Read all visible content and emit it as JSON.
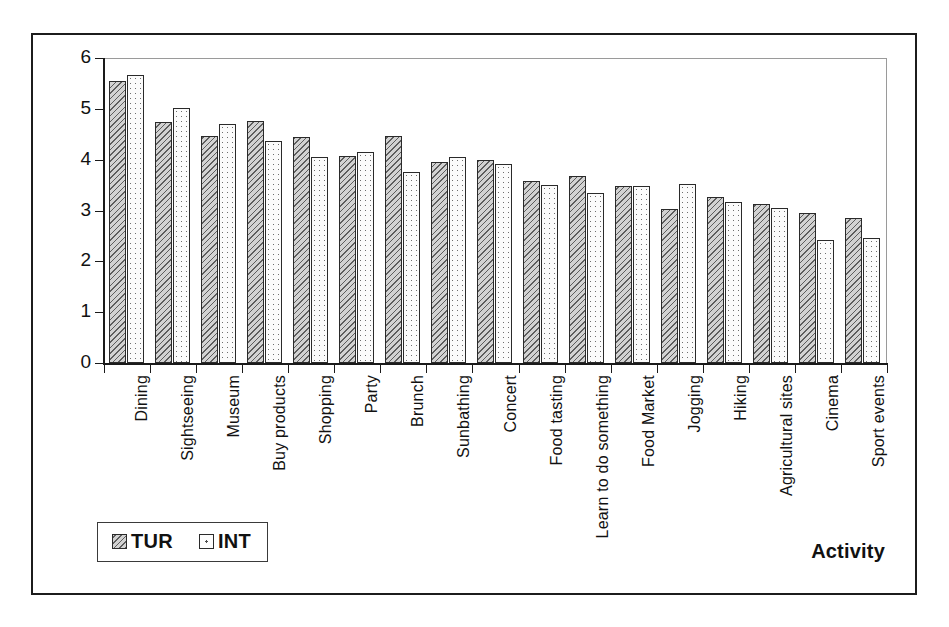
{
  "chart_data": {
    "type": "bar",
    "title": "",
    "xlabel": "Activity",
    "ylabel": "Average (weigthed)",
    "ylim": [
      0,
      6
    ],
    "ytick_labels": [
      "6",
      "5",
      "4",
      "3",
      "2",
      "1",
      "0"
    ],
    "ytick_values": [
      6,
      5,
      4,
      3,
      2,
      1,
      0
    ],
    "grid": false,
    "legend_position": "bottom-left",
    "categories": [
      "Dining",
      "Sightseeing",
      "Museum",
      "Buy products",
      "Shopping",
      "Party",
      "Brunch",
      "Sunbathing",
      "Concert",
      "Food tasting",
      "Learn to do something",
      "Food Market",
      "Jogging",
      "Hiking",
      "Agricultural sites",
      "Cinema",
      "Sport events"
    ],
    "series": [
      {
        "name": "TUR",
        "pattern": "diagonal-hatch",
        "values": [
          5.54,
          4.75,
          4.46,
          4.76,
          4.45,
          4.08,
          4.47,
          3.95,
          3.99,
          3.59,
          3.68,
          3.49,
          3.02,
          3.26,
          3.13,
          2.96,
          2.86
        ]
      },
      {
        "name": "INT",
        "pattern": "dotted",
        "values": [
          5.66,
          5.01,
          4.71,
          4.36,
          4.06,
          4.16,
          3.76,
          4.05,
          3.92,
          3.51,
          3.34,
          3.49,
          3.52,
          3.17,
          3.05,
          2.42,
          2.46
        ]
      }
    ]
  },
  "legend": {
    "entries": [
      {
        "label": "TUR"
      },
      {
        "label": "INT"
      }
    ]
  },
  "axes": {
    "x_title": "Activity",
    "y_title": "Average (weigthed)"
  }
}
